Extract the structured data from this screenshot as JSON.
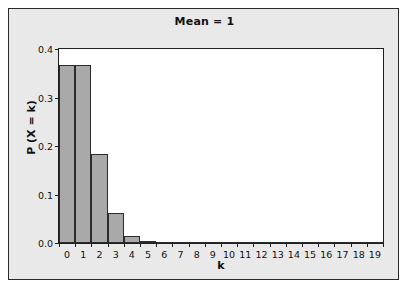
{
  "chart_data": {
    "type": "bar",
    "title": "Mean = 1",
    "xlabel": "k",
    "ylabel": "P (X = k)",
    "categories": [
      "0",
      "1",
      "2",
      "3",
      "4",
      "5",
      "6",
      "7",
      "8",
      "9",
      "10",
      "11",
      "12",
      "13",
      "14",
      "15",
      "16",
      "17",
      "18",
      "19"
    ],
    "values": [
      0.3679,
      0.3679,
      0.1839,
      0.0613,
      0.0153,
      0.0031,
      0.0005,
      0.0001,
      0.0,
      0.0,
      0.0,
      0.0,
      0.0,
      0.0,
      0.0,
      0.0,
      0.0,
      0.0,
      0.0,
      0.0
    ],
    "ylim": [
      0.0,
      0.4
    ],
    "xlim": [
      -0.5,
      19.5
    ],
    "y_ticks": [
      0.0,
      0.1,
      0.2,
      0.3,
      0.4
    ],
    "y_tick_labels": [
      "0.0",
      "0.1",
      "0.2",
      "0.3",
      "0.4"
    ],
    "x_tick_labels": [
      "0",
      "1",
      "2",
      "3",
      "4",
      "5",
      "6",
      "7",
      "8",
      "9",
      "10",
      "11",
      "12",
      "13",
      "14",
      "15",
      "16",
      "17",
      "18",
      "19"
    ],
    "grid": false,
    "legend": null,
    "bar_fill_color": "#a9a9a9",
    "bar_edge_color": "#2b2b2b",
    "plot_background_color": "#ffffff",
    "figure_background_color": "#e9e9e9",
    "frame_color": "#2a2a2a"
  }
}
